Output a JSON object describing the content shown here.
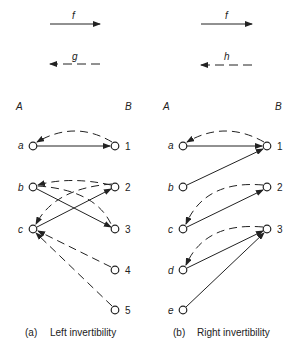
{
  "top_arrows": {
    "left": {
      "forward_label": "f",
      "backward_label": "g"
    },
    "right": {
      "forward_label": "f",
      "backward_label": "h"
    }
  },
  "panels": {
    "left": {
      "domain_label": "A",
      "codomain_label": "B",
      "domain_nodes": [
        "a",
        "b",
        "c"
      ],
      "codomain_nodes": [
        "1",
        "2",
        "3",
        "4",
        "5"
      ],
      "f_edges": [
        [
          "a",
          "1"
        ],
        [
          "b",
          "3"
        ],
        [
          "c",
          "2"
        ]
      ],
      "g_edges": [
        [
          "1",
          "a"
        ],
        [
          "2",
          "b"
        ],
        [
          "3",
          "c"
        ],
        [
          "4",
          "c"
        ],
        [
          "5",
          "c"
        ]
      ],
      "caption_tag": "(a)",
      "caption": "Left invertibility"
    },
    "right": {
      "domain_label": "A",
      "codomain_label": "B",
      "domain_nodes": [
        "a",
        "b",
        "c",
        "d",
        "e"
      ],
      "codomain_nodes": [
        "1",
        "2",
        "3"
      ],
      "f_edges": [
        [
          "a",
          "1"
        ],
        [
          "b",
          "1"
        ],
        [
          "c",
          "2"
        ],
        [
          "d",
          "3"
        ],
        [
          "e",
          "3"
        ]
      ],
      "h_edges": [
        [
          "1",
          "a"
        ],
        [
          "2",
          "c"
        ],
        [
          "3",
          "d"
        ]
      ],
      "caption_tag": "(b)",
      "caption": "Right invertibility"
    }
  },
  "colors": {
    "ink": "#222222",
    "background": "#ffffff"
  }
}
